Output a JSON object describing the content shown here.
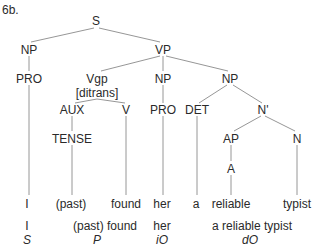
{
  "example_label": "6b.",
  "tree": {
    "S": "S",
    "np_subject": "NP",
    "vp": "VP",
    "pro_subject": "PRO",
    "vgp": "Vgp",
    "vgp_feature": "[ditrans]",
    "np_indirect": "NP",
    "np_direct": "NP",
    "aux": "AUX",
    "v": "V",
    "pro_indirect": "PRO",
    "det": "DET",
    "nbar": "N'",
    "tense": "TENSE",
    "ap": "AP",
    "n": "N",
    "a": "A"
  },
  "leaves": {
    "i": "I",
    "past": "(past)",
    "found": "found",
    "her": "her",
    "a": "a",
    "reliable": "reliable",
    "typist": "typist"
  },
  "functions": {
    "subject_words": "I",
    "subject_label": "S",
    "predicate_words": "(past) found",
    "predicate_label": "P",
    "indirect_object_words": "her",
    "indirect_object_label": "iO",
    "direct_object_words": "a reliable typist",
    "direct_object_label": "dO"
  }
}
